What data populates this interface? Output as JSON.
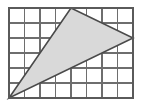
{
  "figure": {
    "type": "geometry-grid-figure",
    "background_color": "#ffffff"
  },
  "grid": {
    "name": "square-grid",
    "columns": 8,
    "rows": 6,
    "origin_px": {
      "x": 9,
      "y": 8
    },
    "cell_width_px": 15.5,
    "cell_height_px": 15,
    "width_px": 124,
    "height_px": 90,
    "line_color": "#6e6e6e",
    "line_width_px": 1.2,
    "border_color": "#5a5a5a",
    "border_width_px": 1.6,
    "vertical_line_x_px": [
      9,
      24.5,
      40,
      55.5,
      71,
      86.5,
      102,
      117.5,
      133
    ],
    "horizontal_line_y_px": [
      8,
      23,
      38,
      53,
      68,
      83,
      98
    ]
  },
  "shape": {
    "name": "shaded-triangle",
    "kind": "triangle",
    "fill_color": "#d9d9d9",
    "fill_opacity": 1,
    "stroke_color": "#4a4a4a",
    "stroke_width_px": 1.6,
    "vertices_grid": [
      {
        "label": "bottom-left-vertex",
        "col": 0,
        "row": 6
      },
      {
        "label": "top-apex-vertex",
        "col": 4,
        "row": 0
      },
      {
        "label": "right-vertex",
        "col": 8,
        "row": 2
      }
    ],
    "vertices_px": [
      {
        "label": "bottom-left-vertex",
        "x": 9,
        "y": 98
      },
      {
        "label": "top-apex-vertex",
        "x": 71,
        "y": 8
      },
      {
        "label": "right-vertex",
        "x": 133,
        "y": 38
      }
    ],
    "points_attr": "9,98 71,8 133,38"
  }
}
